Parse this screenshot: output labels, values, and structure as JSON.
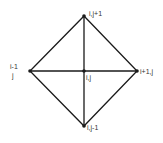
{
  "diagram": {
    "type": "finite-element-stencil",
    "colors": {
      "line": "#1a1a1a",
      "node": "#1a1a1a",
      "text": "#333333",
      "background": "#ffffff"
    },
    "nodes": {
      "top": {
        "label": "i,j+1",
        "x": 84,
        "y": 16
      },
      "left": {
        "label_line1": "i-1",
        "label_line2": "j",
        "x": 30,
        "y": 71
      },
      "center": {
        "label": "i,j",
        "x": 84,
        "y": 71
      },
      "right": {
        "label": "i+1,j",
        "x": 137,
        "y": 71
      },
      "bottom": {
        "label": "i,j-1",
        "x": 84,
        "y": 126
      }
    },
    "edges": [
      [
        "top",
        "right"
      ],
      [
        "right",
        "bottom"
      ],
      [
        "bottom",
        "left"
      ],
      [
        "left",
        "top"
      ],
      [
        "top",
        "bottom"
      ],
      [
        "left",
        "right"
      ]
    ]
  }
}
